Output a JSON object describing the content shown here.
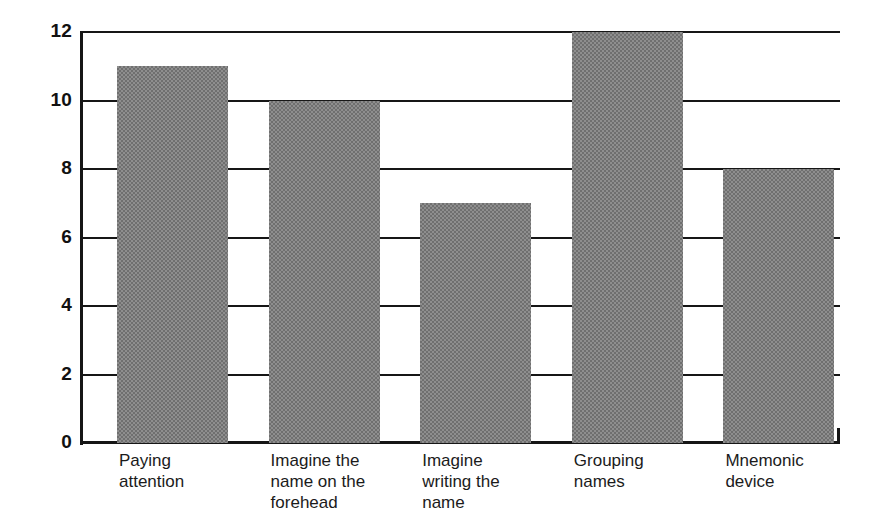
{
  "chart_data": {
    "type": "bar",
    "title": "",
    "xlabel": "",
    "ylabel": "",
    "categories": [
      "Paying\nattention",
      "Imagine the\nname on the\nforehead",
      "Imagine\nwriting the\nname",
      "Grouping\nnames",
      "Mnemonic\ndevice"
    ],
    "values": [
      11,
      10,
      7,
      12,
      8
    ],
    "ylim": [
      0,
      12
    ],
    "yticks": [
      0,
      2,
      4,
      6,
      8,
      10,
      12
    ],
    "ytick_labels": [
      "0",
      "2",
      "4",
      "6",
      "8",
      "10",
      "12"
    ],
    "grid": true,
    "grid_axis": "y",
    "legend": false,
    "bar_color": "#8e8e8e",
    "bar_pattern": "dithered-halftone-gray",
    "axis_color": "#161616",
    "background": "#ffffff"
  },
  "axis": {
    "ticks": [
      {
        "label": "12",
        "value": 12
      },
      {
        "label": "10",
        "value": 10
      },
      {
        "label": "8",
        "value": 8
      },
      {
        "label": "6",
        "value": 6
      },
      {
        "label": "4",
        "value": 4
      },
      {
        "label": "2",
        "value": 2
      },
      {
        "label": "0",
        "value": 0
      }
    ]
  },
  "bars": [
    {
      "label": "Paying\nattention",
      "value": 11
    },
    {
      "label": "Imagine the\nname on the\nforehead",
      "value": 10
    },
    {
      "label": "Imagine\nwriting the\nname",
      "value": 7
    },
    {
      "label": "Grouping\nnames",
      "value": 12
    },
    {
      "label": "Mnemonic\ndevice",
      "value": 8
    }
  ]
}
